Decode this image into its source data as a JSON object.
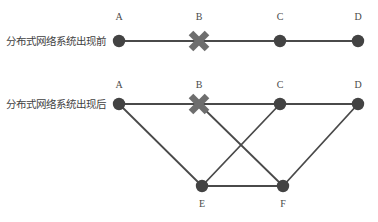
{
  "figure": {
    "background_color": "#ffffff",
    "node_color": "#434343",
    "edge_color": "#4a4a4a",
    "x_mark_color": "#6e6e6e",
    "label_color": "#4a4a4a",
    "row_label_color": "#3f3f3f"
  },
  "rows": [
    {
      "id": "before",
      "label": "分布式网络系统出现前",
      "label_x": 6,
      "label_y": 45,
      "baseline_y": 41,
      "node_label_y": 20,
      "nodes": [
        {
          "id": "A",
          "label": "A",
          "x": 119,
          "y": 41,
          "type": "dot"
        },
        {
          "id": "B",
          "label": "B",
          "x": 199,
          "y": 41,
          "type": "failed"
        },
        {
          "id": "C",
          "label": "C",
          "x": 280,
          "y": 41,
          "type": "dot"
        },
        {
          "id": "D",
          "label": "D",
          "x": 358,
          "y": 41,
          "type": "dot"
        }
      ],
      "edges": [
        {
          "from": "A",
          "to": "B"
        },
        {
          "from": "B",
          "to": "C"
        },
        {
          "from": "C",
          "to": "D"
        }
      ]
    },
    {
      "id": "after",
      "label": "分布式网络系统出现后",
      "label_x": 6,
      "label_y": 108,
      "baseline_y": 104,
      "node_label_y": 88,
      "bottom_label_y": 207,
      "nodes": [
        {
          "id": "A",
          "label": "A",
          "x": 119,
          "y": 104,
          "type": "dot"
        },
        {
          "id": "B",
          "label": "B",
          "x": 199,
          "y": 104,
          "type": "failed"
        },
        {
          "id": "C",
          "label": "C",
          "x": 280,
          "y": 104,
          "type": "dot"
        },
        {
          "id": "D",
          "label": "D",
          "x": 358,
          "y": 104,
          "type": "dot"
        },
        {
          "id": "E",
          "label": "E",
          "x": 202,
          "y": 186,
          "type": "dot"
        },
        {
          "id": "F",
          "label": "F",
          "x": 283,
          "y": 186,
          "type": "dot"
        }
      ],
      "edges": [
        {
          "from": "A",
          "to": "B"
        },
        {
          "from": "B",
          "to": "C"
        },
        {
          "from": "C",
          "to": "D"
        },
        {
          "from": "A",
          "to": "E"
        },
        {
          "from": "B",
          "to": "F"
        },
        {
          "from": "C",
          "to": "E"
        },
        {
          "from": "D",
          "to": "F"
        },
        {
          "from": "E",
          "to": "F"
        }
      ]
    }
  ]
}
